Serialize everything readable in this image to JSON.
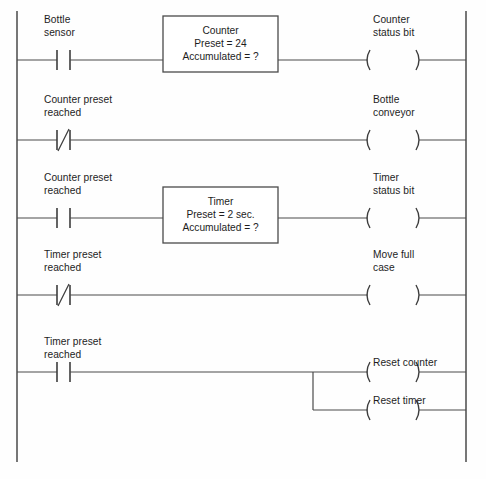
{
  "diagram": {
    "type": "ladder-logic",
    "colors": {
      "line": "#4a4a4a",
      "text": "#1d1d1d",
      "background": "#fefefe"
    },
    "rails": {
      "left_label": "left-power-rail",
      "right_label": "right-power-rail"
    },
    "rungs": [
      {
        "id": "rung-1",
        "contact": {
          "type": "normally-open",
          "label_line1": "Bottle",
          "label_line2": "sensor"
        },
        "block": {
          "line1": "Counter",
          "line2": "Preset = 24",
          "line3": "Accumulated = ?"
        },
        "outputs": [
          {
            "type": "coil",
            "label_line1": "Counter",
            "label_line2": "status bit"
          }
        ]
      },
      {
        "id": "rung-2",
        "contact": {
          "type": "normally-closed",
          "label_line1": "Counter preset",
          "label_line2": "reached"
        },
        "block": null,
        "outputs": [
          {
            "type": "coil",
            "label_line1": "Bottle",
            "label_line2": "conveyor"
          }
        ]
      },
      {
        "id": "rung-3",
        "contact": {
          "type": "normally-open",
          "label_line1": "Counter preset",
          "label_line2": "reached"
        },
        "block": {
          "line1": "Timer",
          "line2": "Preset = 2 sec.",
          "line3": "Accumulated = ?"
        },
        "outputs": [
          {
            "type": "coil",
            "label_line1": "Timer",
            "label_line2": "status bit"
          }
        ]
      },
      {
        "id": "rung-4",
        "contact": {
          "type": "normally-closed",
          "label_line1": "Timer preset",
          "label_line2": "reached"
        },
        "block": null,
        "outputs": [
          {
            "type": "coil",
            "label_line1": "Move full",
            "label_line2": "case"
          }
        ]
      },
      {
        "id": "rung-5",
        "contact": {
          "type": "normally-open",
          "label_line1": "Timer preset",
          "label_line2": "reached"
        },
        "block": null,
        "branched": true,
        "outputs": [
          {
            "type": "coil",
            "label_line1": "Reset counter",
            "label_line2": ""
          },
          {
            "type": "coil",
            "label_line1": "Reset timer",
            "label_line2": ""
          }
        ]
      }
    ]
  }
}
